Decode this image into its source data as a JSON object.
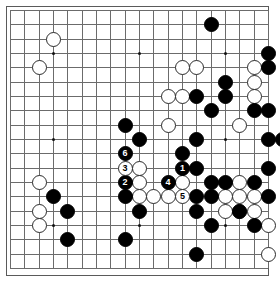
{
  "app": {
    "kind": "go-board-diagram",
    "title": "Go board diagram",
    "board_size": 19,
    "colors": {
      "background": "#ffffff",
      "grid_line": "#6b6b6b",
      "board_border": "#5a5a5a",
      "black_stone": "#000000",
      "white_stone": "#ffffff",
      "white_stone_border": "#2b2b2b",
      "black_number_text": "#ffffff",
      "white_number_text": "#000000"
    },
    "geometry": {
      "origin_x": 10,
      "origin_y": 10,
      "spacing": 14.33,
      "stone_diameter": 15,
      "lines": 19
    },
    "hoshi_points": [
      [
        3,
        3
      ],
      [
        9,
        3
      ],
      [
        15,
        3
      ],
      [
        3,
        9
      ],
      [
        9,
        9
      ],
      [
        15,
        9
      ],
      [
        3,
        15
      ],
      [
        9,
        15
      ],
      [
        15,
        15
      ]
    ]
  },
  "board": {
    "black_stones": [
      [
        14,
        1
      ],
      [
        18,
        3
      ],
      [
        18,
        4
      ],
      [
        15,
        5
      ],
      [
        13,
        6
      ],
      [
        15,
        6
      ],
      [
        14,
        7
      ],
      [
        18,
        7
      ],
      [
        17,
        7
      ],
      [
        8,
        8
      ],
      [
        9,
        9
      ],
      [
        13,
        9
      ],
      [
        12,
        10
      ],
      [
        18,
        9
      ],
      [
        19,
        9
      ],
      [
        8,
        10
      ],
      [
        8,
        11
      ],
      [
        13,
        11
      ],
      [
        18,
        11
      ],
      [
        17,
        12
      ],
      [
        3,
        13
      ],
      [
        4,
        14
      ],
      [
        14,
        12
      ],
      [
        15,
        12
      ],
      [
        12,
        13
      ],
      [
        8,
        13
      ],
      [
        13,
        13
      ],
      [
        14,
        13
      ],
      [
        18,
        13
      ],
      [
        16,
        14
      ],
      [
        9,
        14
      ],
      [
        13,
        14
      ],
      [
        4,
        16
      ],
      [
        14,
        15
      ],
      [
        17,
        15
      ],
      [
        13,
        17
      ],
      [
        8,
        16
      ]
    ],
    "white_stones": [
      [
        3,
        2
      ],
      [
        2,
        4
      ],
      [
        12,
        4
      ],
      [
        13,
        4
      ],
      [
        17,
        4
      ],
      [
        17,
        5
      ],
      [
        12,
        6
      ],
      [
        11,
        6
      ],
      [
        11,
        8
      ],
      [
        17,
        6
      ],
      [
        16,
        8
      ],
      [
        2,
        12
      ],
      [
        9,
        11
      ],
      [
        12,
        11
      ],
      [
        2,
        14
      ],
      [
        2,
        15
      ],
      [
        9,
        12
      ],
      [
        12,
        12
      ],
      [
        16,
        12
      ],
      [
        10,
        13
      ],
      [
        11,
        13
      ],
      [
        12,
        13
      ],
      [
        9,
        13
      ],
      [
        15,
        13
      ],
      [
        16,
        13
      ],
      [
        17,
        13
      ],
      [
        15,
        14
      ],
      [
        16,
        14
      ],
      [
        17,
        14
      ],
      [
        18,
        15
      ],
      [
        18,
        17
      ]
    ],
    "numbered_moves": [
      {
        "label": "1",
        "color": "black",
        "col": 12,
        "row": 11
      },
      {
        "label": "2",
        "color": "black",
        "col": 8,
        "row": 12
      },
      {
        "label": "3",
        "color": "white",
        "col": 8,
        "row": 11
      },
      {
        "label": "4",
        "color": "black",
        "col": 11,
        "row": 12
      },
      {
        "label": "5",
        "color": "white",
        "col": 12,
        "row": 13
      },
      {
        "label": "6",
        "color": "black",
        "col": 8,
        "row": 10
      }
    ]
  }
}
